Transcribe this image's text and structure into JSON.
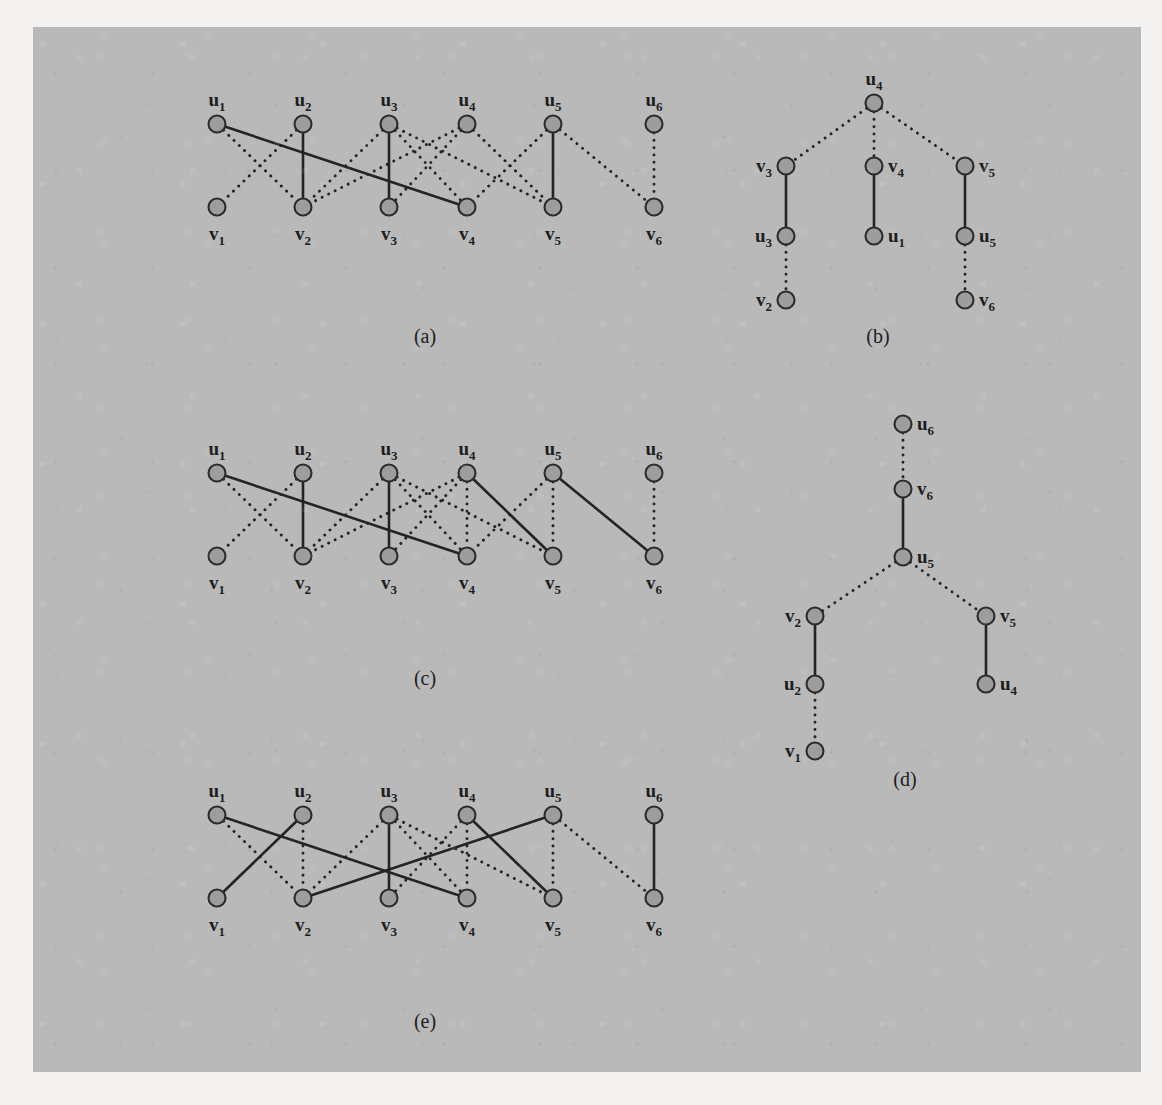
{
  "figure": {
    "background_color": "#b9b9b9",
    "page_color": "#f4f3f1",
    "node_fill": "#9d9d9d",
    "node_stroke": "#2c2c2c",
    "edge_color": "#242424",
    "panels": [
      {
        "id": "a",
        "caption": "(a)",
        "type": "bipartite",
        "top_labels": [
          "u₁",
          "u₂",
          "u₃",
          "u₄",
          "u₅",
          "u₆"
        ],
        "bottom_labels": [
          "v₁",
          "v₂",
          "v₃",
          "v₄",
          "v₅",
          "v₆"
        ],
        "solid_edges": [
          [
            1,
            4
          ],
          [
            2,
            2
          ],
          [
            3,
            3
          ],
          [
            5,
            5
          ]
        ],
        "dotted_edges": [
          [
            1,
            2
          ],
          [
            2,
            1
          ],
          [
            3,
            2
          ],
          [
            3,
            4
          ],
          [
            3,
            5
          ],
          [
            4,
            2
          ],
          [
            4,
            3
          ],
          [
            4,
            5
          ],
          [
            5,
            4
          ],
          [
            5,
            6
          ],
          [
            6,
            6
          ]
        ]
      },
      {
        "id": "b",
        "caption": "(b)",
        "type": "tree",
        "nodes": [
          {
            "key": "u4",
            "label": "u₄",
            "label_side": "top"
          },
          {
            "key": "v3",
            "label": "v₃",
            "label_side": "left"
          },
          {
            "key": "v4",
            "label": "v₄",
            "label_side": "right"
          },
          {
            "key": "v5",
            "label": "v₅",
            "label_side": "right"
          },
          {
            "key": "u3",
            "label": "u₃",
            "label_side": "left"
          },
          {
            "key": "u1",
            "label": "u₁",
            "label_side": "right"
          },
          {
            "key": "u5",
            "label": "u₅",
            "label_side": "right"
          },
          {
            "key": "v2",
            "label": "v₂",
            "label_side": "left"
          },
          {
            "key": "v6",
            "label": "v₆",
            "label_side": "right"
          }
        ],
        "solid_edges": [
          [
            "v3",
            "u3"
          ],
          [
            "v4",
            "u1"
          ],
          [
            "v5",
            "u5"
          ]
        ],
        "dotted_edges": [
          [
            "u4",
            "v3"
          ],
          [
            "u4",
            "v4"
          ],
          [
            "u4",
            "v5"
          ],
          [
            "u3",
            "v2"
          ],
          [
            "u5",
            "v6"
          ]
        ]
      },
      {
        "id": "c",
        "caption": "(c)",
        "type": "bipartite",
        "top_labels": [
          "u₁",
          "u₂",
          "u₃",
          "u₄",
          "u₅",
          "u₆"
        ],
        "bottom_labels": [
          "v₁",
          "v₂",
          "v₃",
          "v₄",
          "v₅",
          "v₆"
        ],
        "solid_edges": [
          [
            1,
            4
          ],
          [
            2,
            2
          ],
          [
            3,
            3
          ],
          [
            4,
            5
          ],
          [
            5,
            6
          ]
        ],
        "dotted_edges": [
          [
            1,
            2
          ],
          [
            2,
            1
          ],
          [
            3,
            2
          ],
          [
            3,
            4
          ],
          [
            3,
            5
          ],
          [
            4,
            2
          ],
          [
            4,
            3
          ],
          [
            4,
            4
          ],
          [
            5,
            4
          ],
          [
            5,
            5
          ],
          [
            6,
            6
          ]
        ]
      },
      {
        "id": "d",
        "caption": "(d)",
        "type": "tree",
        "nodes": [
          {
            "key": "u6",
            "label": "u₆",
            "label_side": "right"
          },
          {
            "key": "v6",
            "label": "v₆",
            "label_side": "right"
          },
          {
            "key": "u5",
            "label": "u₅",
            "label_side": "right"
          },
          {
            "key": "v2",
            "label": "v₂",
            "label_side": "left"
          },
          {
            "key": "v5",
            "label": "v₅",
            "label_side": "right"
          },
          {
            "key": "u2",
            "label": "u₂",
            "label_side": "left"
          },
          {
            "key": "u4",
            "label": "u₄",
            "label_side": "right"
          },
          {
            "key": "v1",
            "label": "v₁",
            "label_side": "left"
          }
        ],
        "solid_edges": [
          [
            "v6",
            "u5"
          ],
          [
            "v2",
            "u2"
          ],
          [
            "v5",
            "u4"
          ]
        ],
        "dotted_edges": [
          [
            "u6",
            "v6"
          ],
          [
            "u5",
            "v2"
          ],
          [
            "u5",
            "v5"
          ],
          [
            "u2",
            "v1"
          ]
        ]
      },
      {
        "id": "e",
        "caption": "(e)",
        "type": "bipartite",
        "top_labels": [
          "u₁",
          "u₂",
          "u₃",
          "u₄",
          "u₅",
          "u₆"
        ],
        "bottom_labels": [
          "v₁",
          "v₂",
          "v₃",
          "v₄",
          "v₅",
          "v₆"
        ],
        "solid_edges": [
          [
            1,
            4
          ],
          [
            2,
            1
          ],
          [
            3,
            3
          ],
          [
            4,
            5
          ],
          [
            5,
            2
          ],
          [
            6,
            6
          ]
        ],
        "dotted_edges": [
          [
            1,
            2
          ],
          [
            2,
            2
          ],
          [
            3,
            2
          ],
          [
            3,
            4
          ],
          [
            3,
            5
          ],
          [
            4,
            3
          ],
          [
            4,
            4
          ],
          [
            5,
            5
          ],
          [
            5,
            6
          ]
        ]
      }
    ]
  },
  "background_text": {
    "block_top": "the structure of the graph is determined by the ordering of its vertices and the\nrelations imposed on them. We now describe the algorithm in more detail.\nThe first phase of the procedure constructs an initial matching by a greedy\nscan, and the second phase repeatedly searches for augmenting paths until\nnone remain. Each augmentation increases the size of the matching by one.",
    "block_middle": "Figure 1 illustrates the successive stages of the computation on a small\nbipartite graph. In (a) the initial matching is shown with solid edges and the\nremaining edges of the graph are drawn dotted. Panel (b) gives the alternating\ntree grown from the exposed vertex, and (c) shows the matching after the first\naugmentation has been applied along the path found in the tree.",
    "block_bottom": "The process then repeats. A second alternating tree, displayed in (d), yields\nanother augmenting path, and the resulting maximum matching appears in (e).\nBecause every augmentation strictly increases the cardinality of the matching,\nat most n/2 phases are required. Each phase can be implemented in O(m) time\nusing breadth-first search, so the total running time is O(nm) for a graph with\nn vertices and m edges. Refinements of this bound are discussed in the notes."
  }
}
